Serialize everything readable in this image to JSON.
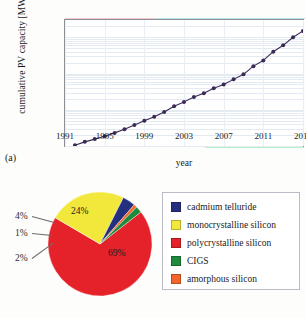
{
  "figure": {
    "panel_a_label": "(a)",
    "panel_b_label": "(b)"
  },
  "chart_data": [
    {
      "type": "line",
      "title": "",
      "xlabel": "year",
      "ylabel": "cumulative PV capacity [MW]",
      "yscale": "log",
      "ylim": [
        100,
        300000
      ],
      "xlim": [
        1991,
        2015
      ],
      "grid": true,
      "legend_position": "none",
      "ytick_labels": [
        "100",
        "1 000",
        "10 000",
        "100 000"
      ],
      "ytick_values": [
        100,
        1000,
        10000,
        100000
      ],
      "xtick_labels": [
        "1991",
        "1995",
        "1999",
        "2003",
        "2007",
        "2011",
        "2015"
      ],
      "xtick_values": [
        1991,
        1995,
        1999,
        2003,
        2007,
        2011,
        2015
      ],
      "series": [
        {
          "name": "cumulative PV capacity",
          "color": "#3a2a55",
          "x": [
            1992,
            1993,
            1994,
            1995,
            1996,
            1997,
            1998,
            1999,
            2000,
            2001,
            2002,
            2003,
            2004,
            2005,
            2006,
            2007,
            2008,
            2009,
            2010,
            2011,
            2012,
            2013,
            2014,
            2015
          ],
          "values": [
            105,
            130,
            155,
            185,
            230,
            290,
            380,
            500,
            640,
            870,
            1250,
            1650,
            2250,
            2850,
            3900,
            5000,
            6900,
            9500,
            16000,
            23000,
            40000,
            60000,
            100000,
            150000,
            230000
          ]
        }
      ]
    },
    {
      "type": "pie",
      "title": "",
      "legend_position": "right",
      "labels": [
        "cadmium telluride",
        "monocrystalline silicon",
        "polycrystalline silicon",
        "CIGS",
        "amorphous silicon"
      ],
      "values": [
        4,
        24,
        69,
        2,
        1
      ],
      "value_labels": [
        "4%",
        "24%",
        "69%",
        "2%",
        "1%"
      ],
      "colors": [
        "#24307e",
        "#f2e73b",
        "#e52229",
        "#1f8a3b",
        "#f2662b"
      ]
    }
  ],
  "pie_callouts": [
    {
      "text": "4%"
    },
    {
      "text": "1%"
    },
    {
      "text": "2%"
    },
    {
      "text": "24%"
    },
    {
      "text": "69%"
    }
  ],
  "legend": {
    "items": [
      {
        "label": "cadmium telluride",
        "color": "#24307e"
      },
      {
        "label": "monocrystalline silicon",
        "color": "#f2e73b"
      },
      {
        "label": "polycrystalline silicon",
        "color": "#e52229"
      },
      {
        "label": "CIGS",
        "color": "#1f8a3b"
      },
      {
        "label": "amorphous silicon",
        "color": "#f2662b"
      }
    ]
  }
}
